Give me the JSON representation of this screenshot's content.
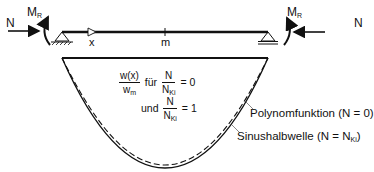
{
  "diagram": {
    "type": "beam-deflection",
    "beam": {
      "axis_label": "x",
      "midpoint_label": "m",
      "left_force_label": "N",
      "right_force_label": "N",
      "left_moment_label": "M",
      "left_moment_sub": "R",
      "right_moment_label": "M",
      "right_moment_sub": "R"
    },
    "formula": {
      "ratio_num": "w(x)",
      "ratio_den_main": "w",
      "ratio_den_sub": "m",
      "fuer": "für",
      "case1_num": "N",
      "case1_den_main": "N",
      "case1_den_sub": "Ki",
      "case1_value": "= 0",
      "und": "und",
      "case2_num": "N",
      "case2_den_main": "N",
      "case2_den_sub": "Ki",
      "case2_value": "= 1"
    },
    "curves": [
      {
        "name": "Polynomfunktion",
        "condition": "(N = 0)",
        "style": "dashed"
      },
      {
        "name": "Sinushalbwelle",
        "condition_prefix": "(N = N",
        "condition_sub": "Ki",
        "condition_suffix": ")",
        "style": "solid"
      }
    ],
    "colors": {
      "line": "#111111",
      "background": "#ffffff"
    }
  }
}
